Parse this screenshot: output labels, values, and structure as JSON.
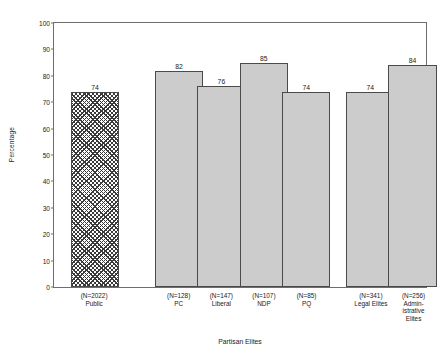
{
  "chart_data": {
    "type": "bar",
    "title": "",
    "xlabel": "Partisan Elites",
    "ylabel": "Percentage",
    "ylim": [
      0,
      100
    ],
    "ytick_labels": [
      "100",
      "90",
      "80",
      "70",
      "60",
      "50",
      "40",
      "30",
      "20",
      "10",
      "0"
    ],
    "ytick_values": [
      100,
      90,
      80,
      70,
      60,
      50,
      40,
      30,
      20,
      10,
      0
    ],
    "grid": false,
    "legend": "none",
    "categories": [
      "Public",
      "PC",
      "Liberal",
      "NDP",
      "PQ",
      "Legal Elites",
      "Administrative Elites"
    ],
    "values": [
      74,
      82,
      76,
      85,
      74,
      74,
      84
    ],
    "sample_sizes": [
      2022,
      128,
      147,
      107,
      85,
      341,
      256
    ],
    "bars": [
      {
        "name": "Public",
        "n_label": "(N=2022)",
        "label_lines": [
          "Public"
        ],
        "value": 74,
        "value_label": "74",
        "style": "hatched",
        "center_pct": 11.0,
        "width_pct": 13.0
      },
      {
        "name": "PC",
        "n_label": "(N=128)",
        "label_lines": [
          "PC"
        ],
        "value": 82,
        "value_label": "82",
        "style": "solid",
        "center_pct": 33.6,
        "width_pct": 13.0
      },
      {
        "name": "Liberal",
        "n_label": "(N=147)",
        "label_lines": [
          "Liberal"
        ],
        "value": 76,
        "value_label": "76",
        "style": "solid",
        "center_pct": 45.0,
        "width_pct": 13.0
      },
      {
        "name": "NDP",
        "n_label": "(N=107)",
        "label_lines": [
          "NDP"
        ],
        "value": 85,
        "value_label": "85",
        "style": "solid",
        "center_pct": 56.4,
        "width_pct": 13.0
      },
      {
        "name": "PQ",
        "n_label": "(N=85)",
        "label_lines": [
          "PQ"
        ],
        "value": 74,
        "value_label": "74",
        "style": "solid",
        "center_pct": 67.8,
        "width_pct": 13.0
      },
      {
        "name": "Legal Elites",
        "n_label": "(N=341)",
        "label_lines": [
          "Legal Elites"
        ],
        "value": 74,
        "value_label": "74",
        "style": "solid",
        "center_pct": 85.0,
        "width_pct": 13.0
      },
      {
        "name": "Administrative Elites",
        "n_label": "(N=256)",
        "label_lines": [
          "Admin-",
          "istrative",
          "Elites"
        ],
        "value": 84,
        "value_label": "84",
        "style": "solid",
        "center_pct": 96.4,
        "width_pct": 13.0
      }
    ],
    "colors": {
      "bar_fill": "#cccccc",
      "bar_edge": "#4a4a4a",
      "hatch": "#3a3a3a",
      "axis": "#6e6e6e",
      "text": "#1a1a1a",
      "background": "#ffffff"
    }
  }
}
